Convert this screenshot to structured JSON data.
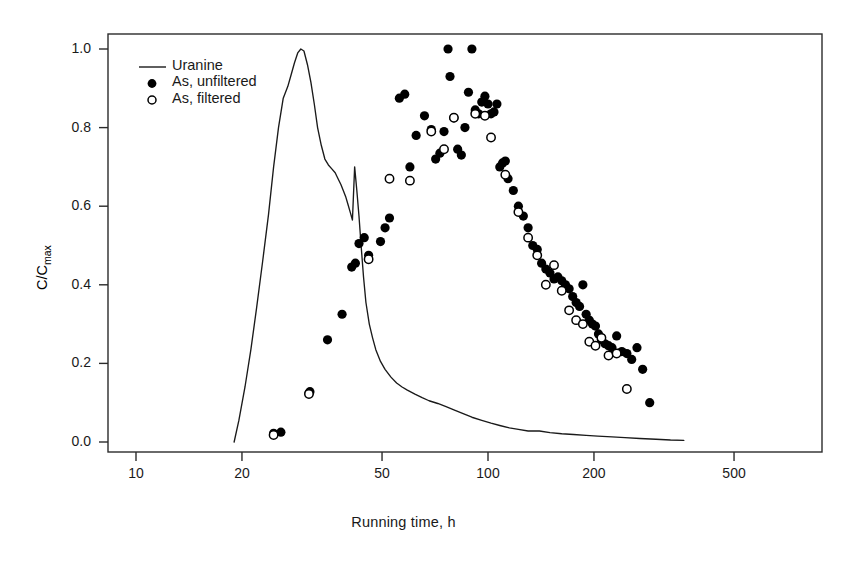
{
  "chart_data": {
    "type": "scatter",
    "title": "",
    "xlabel": "Running time, h",
    "ylabel": "C/Cmax",
    "ylabel_base": "C/C",
    "ylabel_sub": "max",
    "xscale": "log",
    "yscale": "linear",
    "xlim": [
      8.8,
      640
    ],
    "ylim": [
      -0.02,
      1.04
    ],
    "xticks": [
      10,
      20,
      50,
      100,
      200,
      500
    ],
    "xticklabels": [
      "10",
      "20",
      "50",
      "100",
      "200",
      "500"
    ],
    "yticks": [
      0.0,
      0.2,
      0.4,
      0.6,
      0.8,
      1.0
    ],
    "yticklabels": [
      "0.0",
      "0.2",
      "0.4",
      "0.6",
      "0.8",
      "1.0"
    ],
    "grid": false,
    "legend_position": "top-left",
    "legend": [
      {
        "label": "Uranine",
        "marker": "line"
      },
      {
        "label": "As, unfiltered",
        "marker": "filled-circle"
      },
      {
        "label": "As, filtered",
        "marker": "open-circle"
      }
    ],
    "colors": {
      "line": "#1a1a1a",
      "filled": "#000000",
      "open_edge": "#000000",
      "open_fill": "#ffffff",
      "axis": "#2b2b2b",
      "background": "#ffffff"
    },
    "series": [
      {
        "name": "Uranine",
        "type": "line",
        "x": [
          19.0,
          19.6,
          20.4,
          21.2,
          22.0,
          22.9,
          23.8,
          24.6,
          25.4,
          26.2,
          27.0,
          27.6,
          28.2,
          28.8,
          29.4,
          30.0,
          30.7,
          31.4,
          32.1,
          32.8,
          33.6,
          34.4,
          35.2,
          36.0,
          36.8,
          37.5,
          38.2,
          38.8,
          39.4,
          40.0,
          40.6,
          41.2,
          41.8,
          42.4,
          43.0,
          43.6,
          44.3,
          45.0,
          46.0,
          47.0,
          48.0,
          49.5,
          51.0,
          53.0,
          55.0,
          57.0,
          59.0,
          62.0,
          65.0,
          68.0,
          72.0,
          76.0,
          80.0,
          85.0,
          90.0,
          96.0,
          102.0,
          108.0,
          115.0,
          122.0,
          130.0,
          140.0,
          150.0,
          162.0,
          175.0,
          190.0,
          205.0,
          225.0,
          245.0,
          270.0,
          300.0,
          330.0,
          360.0
        ],
        "y": [
          0.0,
          0.055,
          0.14,
          0.235,
          0.34,
          0.46,
          0.58,
          0.7,
          0.8,
          0.875,
          0.905,
          0.935,
          0.965,
          0.99,
          1.0,
          0.995,
          0.96,
          0.915,
          0.86,
          0.8,
          0.755,
          0.72,
          0.705,
          0.695,
          0.685,
          0.67,
          0.655,
          0.64,
          0.625,
          0.605,
          0.585,
          0.565,
          0.7,
          0.64,
          0.575,
          0.5,
          0.42,
          0.355,
          0.3,
          0.265,
          0.235,
          0.205,
          0.185,
          0.165,
          0.15,
          0.14,
          0.132,
          0.122,
          0.113,
          0.105,
          0.098,
          0.09,
          0.082,
          0.072,
          0.063,
          0.055,
          0.048,
          0.042,
          0.036,
          0.032,
          0.028,
          0.028,
          0.024,
          0.021,
          0.019,
          0.017,
          0.015,
          0.013,
          0.011,
          0.009,
          0.007,
          0.005,
          0.004
        ]
      },
      {
        "name": "As, unfiltered",
        "type": "scatter",
        "marker": "filled-circle",
        "x": [
          24.6,
          25.8,
          31.0,
          31.2,
          35.0,
          38.5,
          41.0,
          42.0,
          43.0,
          44.5,
          45.8,
          49.5,
          51.0,
          52.5,
          56.0,
          58.0,
          60.0,
          62.5,
          66.0,
          69.0,
          71.0,
          73.0,
          75.0,
          77.0,
          78.0,
          80.0,
          82.0,
          84.0,
          86.0,
          88.0,
          90.0,
          92.0,
          94.0,
          96.0,
          98.0,
          100.0,
          102.0,
          104.0,
          106.0,
          108.0,
          110.0,
          112.0,
          114.0,
          118.0,
          122.0,
          126.0,
          130.0,
          134.0,
          138.0,
          142.0,
          146.0,
          150.0,
          154.0,
          158.0,
          162.0,
          166.0,
          170.0,
          174.0,
          178.0,
          182.0,
          186.0,
          190.0,
          194.0,
          198.0,
          202.0,
          206.0,
          210.0,
          215.0,
          220.0,
          225.0,
          232.0,
          240.0,
          248.0,
          256.0,
          265.0,
          275.0,
          288.0
        ],
        "y": [
          0.022,
          0.025,
          0.125,
          0.128,
          0.26,
          0.325,
          0.445,
          0.455,
          0.505,
          0.52,
          0.475,
          0.51,
          0.545,
          0.57,
          0.875,
          0.885,
          0.7,
          0.78,
          0.83,
          0.795,
          0.72,
          0.735,
          0.79,
          1.0,
          0.93,
          0.825,
          0.745,
          0.73,
          0.8,
          0.89,
          1.0,
          0.845,
          0.835,
          0.865,
          0.88,
          0.86,
          0.835,
          0.84,
          0.86,
          0.7,
          0.71,
          0.715,
          0.67,
          0.64,
          0.6,
          0.575,
          0.545,
          0.5,
          0.49,
          0.455,
          0.44,
          0.43,
          0.415,
          0.42,
          0.41,
          0.4,
          0.39,
          0.37,
          0.355,
          0.345,
          0.4,
          0.325,
          0.31,
          0.3,
          0.295,
          0.275,
          0.26,
          0.25,
          0.245,
          0.24,
          0.27,
          0.23,
          0.225,
          0.21,
          0.24,
          0.185,
          0.1
        ]
      },
      {
        "name": "As, filtered",
        "type": "scatter",
        "marker": "open-circle",
        "x": [
          24.6,
          31.0,
          45.8,
          52.5,
          60.0,
          69.0,
          75.0,
          80.0,
          92.0,
          98.0,
          102.0,
          112.0,
          122.0,
          130.0,
          138.0,
          146.0,
          154.0,
          162.0,
          170.0,
          178.0,
          186.0,
          194.0,
          202.0,
          210.0,
          220.0,
          232.0,
          248.0
        ],
        "y": [
          0.018,
          0.122,
          0.465,
          0.67,
          0.665,
          0.79,
          0.745,
          0.825,
          0.835,
          0.83,
          0.775,
          0.68,
          0.585,
          0.52,
          0.475,
          0.4,
          0.45,
          0.385,
          0.335,
          0.31,
          0.3,
          0.255,
          0.245,
          0.265,
          0.22,
          0.225,
          0.135
        ]
      }
    ]
  },
  "plot_geometry": {
    "left": 108,
    "right": 822,
    "top": 34,
    "bottom": 452,
    "x10_px": 136,
    "px_per_decade": 352,
    "y0_px": 442,
    "y1_px": 49
  }
}
